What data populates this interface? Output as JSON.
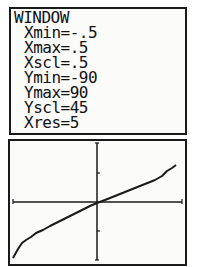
{
  "window_screen": {
    "title": "WINDOW",
    "settings": [
      {
        "name": "Xmin",
        "value": "-.5",
        "text": "Xmin=-.5"
      },
      {
        "name": "Xmax",
        "value": ".5",
        "text": "Xmax=.5"
      },
      {
        "name": "Xscl",
        "value": ".5",
        "text": "Xscl=.5"
      },
      {
        "name": "Ymin",
        "value": "-90",
        "text": "Ymin=-90"
      },
      {
        "name": "Ymax",
        "value": "90",
        "text": "Ymax=90"
      },
      {
        "name": "Yscl",
        "value": "45",
        "text": "Yscl=45"
      },
      {
        "name": "Xres",
        "value": "5",
        "text": "Xres=5"
      }
    ]
  },
  "graph_screen": {
    "xlim": [
      -0.5,
      0.5
    ],
    "ylim": [
      -90,
      90
    ],
    "x_tick_step": 0.5,
    "y_tick_step": 45,
    "curve_color": "#1a1a1a"
  }
}
